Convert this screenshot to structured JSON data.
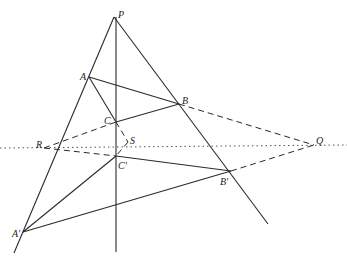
{
  "diagram": {
    "labels": {
      "P": "P",
      "A": "A",
      "B": "B",
      "C": "C",
      "S": "S",
      "R": "R",
      "Q": "Q",
      "C_prime": "C′",
      "B_prime": "B′",
      "A_prime": "A′"
    },
    "points": {
      "P": [
        114,
        17
      ],
      "A": [
        89,
        77
      ],
      "B": [
        179,
        104
      ],
      "C": [
        116,
        122
      ],
      "S": [
        128,
        142
      ],
      "R": [
        44,
        147
      ],
      "Q": [
        314,
        145
      ],
      "C_prime": [
        116,
        156
      ],
      "B_prime": [
        231,
        171
      ],
      "A_prime": [
        23,
        232
      ]
    },
    "colors": {
      "line": "#2a2a2a",
      "text": "#222222",
      "background": "#ffffff"
    }
  }
}
